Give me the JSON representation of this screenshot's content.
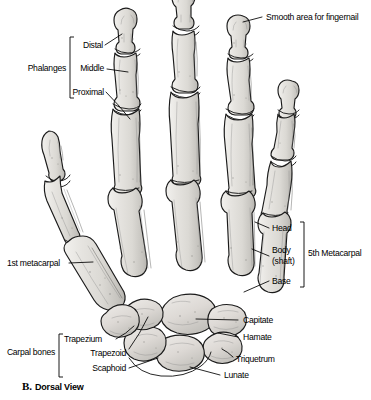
{
  "figure": {
    "caption_letter": "B.",
    "caption_text": "Dorsal View",
    "view": "Dorsal View"
  },
  "colors": {
    "bone_light": "#eceae6",
    "bone_mid": "#dedcd7",
    "bone_shadow": "#b9b7b2",
    "outline": "#1b1b1b",
    "leader": "#000000",
    "background": "#ffffff",
    "text": "#000000"
  },
  "groups": {
    "phalanges": {
      "label": "Phalanges",
      "items": [
        {
          "label": "Distal"
        },
        {
          "label": "Middle"
        },
        {
          "label": "Proximal"
        }
      ]
    },
    "fifth_metacarpal": {
      "label": "5th Metacarpal",
      "items": [
        {
          "label": "Head"
        },
        {
          "label": "Body\n(shaft)"
        },
        {
          "label": "Body"
        },
        {
          "label": "(shaft)"
        },
        {
          "label": "Base"
        }
      ]
    },
    "carpal_bones": {
      "label": "Carpal bones",
      "items": [
        {
          "label": "Trapezium"
        },
        {
          "label": "Trapezoid"
        },
        {
          "label": "Scaphoid"
        }
      ]
    }
  },
  "labels": {
    "smooth_area": "Smooth area for fingernail",
    "first_metacarpal": "1st metacarpal",
    "head": "Head",
    "body": "Body",
    "shaft": "(shaft)",
    "base": "Base",
    "fifth_metacarpal": "5th Metacarpal",
    "phalanges": "Phalanges",
    "distal": "Distal",
    "middle": "Middle",
    "proximal": "Proximal",
    "carpal_bones": "Carpal bones",
    "trapezium": "Trapezium",
    "trapezoid": "Trapezoid",
    "scaphoid": "Scaphoid",
    "capitate": "Capitate",
    "hamate": "Hamate",
    "triquetrum": "Triquetrum",
    "lunate": "Lunate"
  }
}
